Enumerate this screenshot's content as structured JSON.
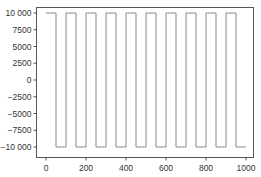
{
  "chart_data": {
    "type": "line",
    "title": "",
    "xlabel": "",
    "ylabel": "",
    "xlim": [
      -50,
      1035
    ],
    "ylim": [
      -11000,
      11000
    ],
    "grid": false,
    "legend": null,
    "x_ticks": [
      0,
      200,
      400,
      600,
      800,
      1000
    ],
    "x_tick_labels": [
      "0",
      "200",
      "400",
      "600",
      "800",
      "1000"
    ],
    "y_ticks": [
      10000,
      7500,
      5000,
      2500,
      0,
      -2500,
      -5000,
      -7500,
      -10000
    ],
    "y_tick_labels": [
      "10 000",
      "7500",
      "5000",
      "2500",
      "0",
      "−2500",
      "−5000",
      "−7500",
      "−10 000"
    ],
    "series": [
      {
        "name": "square wave",
        "color": "#888888",
        "x": [
          0,
          50,
          50,
          100,
          100,
          150,
          150,
          200,
          200,
          250,
          250,
          300,
          300,
          350,
          350,
          400,
          400,
          450,
          450,
          500,
          500,
          550,
          550,
          600,
          600,
          650,
          650,
          700,
          700,
          750,
          750,
          800,
          800,
          850,
          850,
          900,
          900,
          950,
          950,
          1000
        ],
        "y": [
          10000,
          10000,
          -10000,
          -10000,
          10000,
          10000,
          -10000,
          -10000,
          10000,
          10000,
          -10000,
          -10000,
          10000,
          10000,
          -10000,
          -10000,
          10000,
          10000,
          -10000,
          -10000,
          10000,
          10000,
          -10000,
          -10000,
          10000,
          10000,
          -10000,
          -10000,
          10000,
          10000,
          -10000,
          -10000,
          10000,
          10000,
          -10000,
          -10000,
          10000,
          10000,
          -10000,
          -10000
        ]
      }
    ]
  },
  "colors": {
    "frame": "#555555",
    "line": "#888888",
    "text": "#333333"
  }
}
